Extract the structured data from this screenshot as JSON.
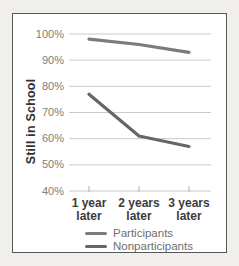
{
  "figure": {
    "background": "#f0efeb",
    "panel_background": "#ffffff",
    "panel_border_color": "#57575b"
  },
  "chart_data": {
    "type": "line",
    "title": "",
    "xlabel": "",
    "ylabel": "Still in School",
    "categories": [
      "1 year\nlater",
      "2 years\nlater",
      "3 years\nlater"
    ],
    "series": [
      {
        "name": "Participants",
        "values": [
          98,
          96,
          93
        ],
        "color": "#7b7b7b"
      },
      {
        "name": "Nonparticipants",
        "values": [
          77,
          61,
          57
        ],
        "color": "#666666"
      }
    ],
    "ylim": [
      40,
      100
    ],
    "ytick_step": 10,
    "ytick_labels": [
      "100%",
      "90%",
      "80%",
      "70%",
      "60%",
      "50%",
      "40%"
    ],
    "grid": true,
    "gridline_color": "#c9c9c9",
    "tick_color": "#b0b0b0",
    "legend_position": "bottom",
    "ytick_label_color": "#7d7d7d",
    "xtick_label_color": "#3b3b3b",
    "axis_title_color": "#323232",
    "legend_text_color": "#6e6e6e"
  }
}
